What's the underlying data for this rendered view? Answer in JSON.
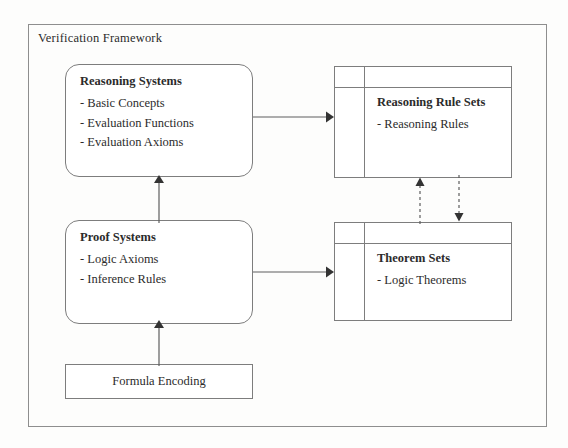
{
  "diagram": {
    "frame_title": "Verification Framework",
    "nodes": {
      "reasoning_systems": {
        "title": "Reasoning Systems",
        "bullets": [
          "- Basic Concepts",
          "- Evaluation Functions",
          "- Evaluation Axioms"
        ]
      },
      "reasoning_rule_sets": {
        "title": "Reasoning Rule Sets",
        "bullets": [
          "- Reasoning Rules"
        ]
      },
      "proof_systems": {
        "title": "Proof Systems",
        "bullets": [
          "- Logic Axioms",
          "- Inference Rules"
        ]
      },
      "theorem_sets": {
        "title": "Theorem Sets",
        "bullets": [
          "- Logic Theorems"
        ]
      },
      "formula_encoding": {
        "label": "Formula Encoding"
      }
    },
    "edges": [
      {
        "name": "reasoning-systems-to-reasoning-rule-sets",
        "style": "solid",
        "direction": "right"
      },
      {
        "name": "proof-systems-to-theorem-sets",
        "style": "solid",
        "direction": "right"
      },
      {
        "name": "proof-systems-to-reasoning-systems",
        "style": "solid",
        "direction": "up"
      },
      {
        "name": "formula-encoding-to-proof-systems",
        "style": "solid",
        "direction": "up"
      },
      {
        "name": "theorem-sets-to-reasoning-rule-sets",
        "style": "dashed",
        "direction": "up"
      },
      {
        "name": "reasoning-rule-sets-to-theorem-sets",
        "style": "dashed",
        "direction": "down"
      }
    ],
    "colors": {
      "line": "#7d7d7d",
      "frame_line": "#8e8e8e",
      "text": "#2b2b2b",
      "background": "#fdfdfc"
    }
  }
}
